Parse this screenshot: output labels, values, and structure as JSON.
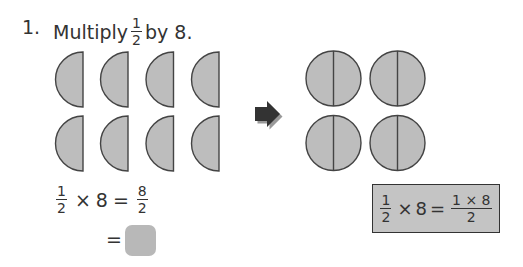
{
  "question": {
    "number": "1.",
    "prefix": "Multiply",
    "fraction": {
      "numerator": "1",
      "denominator": "2"
    },
    "suffix": "by 8."
  },
  "left_figure": {
    "shape": "half-circle",
    "count": 8,
    "rows": 2,
    "columns": 4,
    "fill": "#bdbdbd",
    "stroke": "#444444"
  },
  "arrow": {
    "icon": "right-arrow-icon",
    "color": "#333333"
  },
  "right_figure": {
    "shape": "whole-circle-split-in-halves",
    "count": 4,
    "rows": 2,
    "columns": 2,
    "fill": "#bdbdbd",
    "stroke": "#444444"
  },
  "equation1": {
    "lhs_fraction": {
      "numerator": "1",
      "denominator": "2"
    },
    "times": "×",
    "factor": "8",
    "equals": "=",
    "rhs_fraction": {
      "numerator": "8",
      "denominator": "2"
    }
  },
  "equation2": {
    "equals": "=",
    "answer_blank": ""
  },
  "formula_box": {
    "lhs_fraction": {
      "numerator": "1",
      "denominator": "2"
    },
    "times": "×",
    "factor": "8",
    "equals": "=",
    "rhs_fraction": {
      "numerator": "1 × 8",
      "denominator": "2"
    },
    "fill": "#c4c4c4"
  }
}
